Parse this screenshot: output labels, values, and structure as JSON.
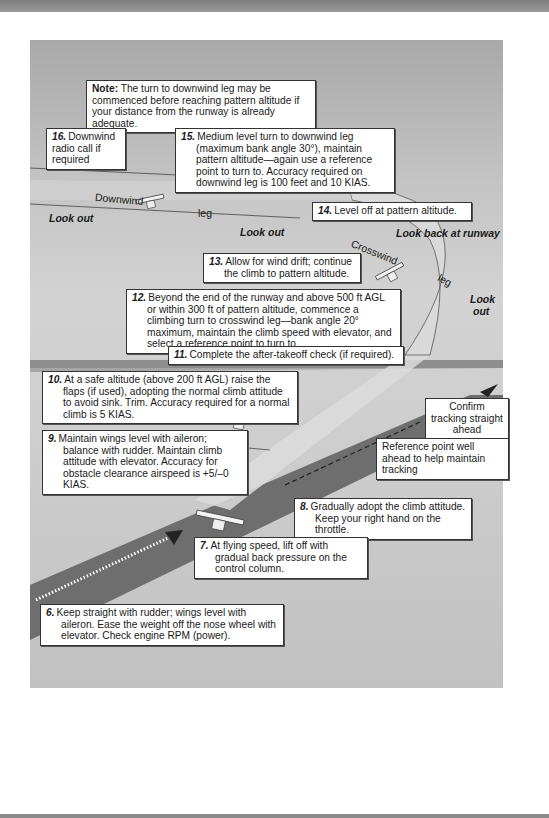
{
  "figure": {
    "colors": {
      "panel_gray": "#c4c4c4",
      "runway_dark": "#6e6e6e",
      "ground_path": "#d8d8d8",
      "horizon": "#8e8e8e",
      "box_bg": "#ffffff"
    }
  },
  "note": {
    "label": "Note:",
    "text": " The turn to downwind leg may be commenced before reaching pattern altitude if your distance from the runway is already adequate."
  },
  "steps": [
    {
      "num": "16.",
      "text": "Downwind radio call if required"
    },
    {
      "num": "15.",
      "text": "Medium level turn to downwind leg (maximum bank angle 30°), maintain pattern altitude—again use a reference point to turn to. Accuracy required on downwind leg is 100 feet and 10 KIAS."
    },
    {
      "num": "14.",
      "text": "Level off at pattern altitude."
    },
    {
      "num": "13.",
      "text": "Allow for wind drift; continue the climb to pattern altitude."
    },
    {
      "num": "12.",
      "text": "Beyond the end of the runway and above 500 ft AGL or within 300 ft of pattern altitude, commence a climbing turn to crosswind leg—bank angle 20° maximum, maintain the climb speed with elevator, and select a reference point to turn to."
    },
    {
      "num": "11.",
      "text": "Complete the after-takeoff check (if required)."
    },
    {
      "num": "10.",
      "text": "At a safe altitude (above 200 ft AGL) raise the flaps (if used), adopting the normal climb attitude to avoid sink. Trim. Accuracy required for a normal climb is 5 KIAS."
    },
    {
      "num": "9.",
      "text": "Maintain wings level with aileron; balance with rudder. Maintain climb attitude with elevator. Accuracy for obstacle clearance airspeed is +5/–0 KIAS."
    },
    {
      "num": "8.",
      "text": "Gradually adopt the climb attitude. Keep your right hand on the throttle."
    },
    {
      "num": "7.",
      "text": "At flying speed, lift off with gradual back pressure on the control column."
    },
    {
      "num": "6.",
      "text": "Keep straight with rudder; wings level with aileron. Ease the weight off the nose wheel with elevator. Check engine RPM (power)."
    }
  ],
  "callouts": {
    "confirm_tracking": "Confirm tracking straight ahead",
    "reference_point": "Reference point well ahead to help maintain tracking"
  },
  "path_labels": {
    "downwind": "Downwind",
    "leg_downwind": "leg",
    "crosswind": "Crosswind",
    "leg_crosswind": "leg",
    "look_out_left": "Look out",
    "look_out_mid": "Look out",
    "look_back": "Look back at runway",
    "look_out_right_1": "Look",
    "look_out_right_2": "out"
  }
}
